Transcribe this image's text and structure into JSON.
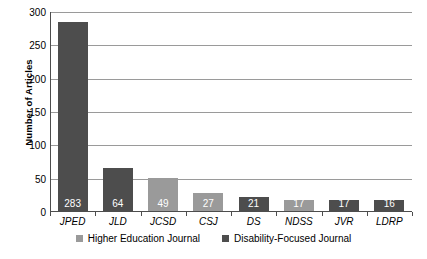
{
  "chart_data": {
    "type": "bar",
    "title": "",
    "xlabel": "",
    "ylabel": "Number of Articles",
    "categories": [
      "JPED",
      "JLD",
      "JCSD",
      "CSJ",
      "DS",
      "NDSS",
      "JVR",
      "LDRP"
    ],
    "values": [
      283,
      64,
      49,
      27,
      21,
      17,
      17,
      16
    ],
    "point_labels": [
      "283",
      "64",
      "49",
      "27",
      "21",
      "17",
      "17",
      "16"
    ],
    "series_of_point": [
      "Disability-Focused Journal",
      "Disability-Focused Journal",
      "Higher Education Journal",
      "Higher Education Journal",
      "Disability-Focused Journal",
      "Higher Education Journal",
      "Disability-Focused Journal",
      "Disability-Focused Journal"
    ],
    "ylim": [
      0,
      300
    ],
    "yticks": [
      0,
      50,
      100,
      150,
      200,
      250,
      300
    ],
    "ytick_labels": [
      "0",
      "50",
      "100",
      "150",
      "200",
      "250",
      "300"
    ],
    "grid": true,
    "legend_position": "bottom",
    "legend": [
      {
        "label": "Higher Education Journal",
        "color": "#9a9a9a"
      },
      {
        "label": "Disability-Focused Journal",
        "color": "#4d4d4d"
      }
    ]
  },
  "colors": {
    "higher_education": "#9a9a9a",
    "disability_focused": "#4d4d4d",
    "gridline": "#9a9a9a",
    "axis": "#4d4d4d",
    "background": "#ffffff",
    "value_label": "#ffffff"
  }
}
